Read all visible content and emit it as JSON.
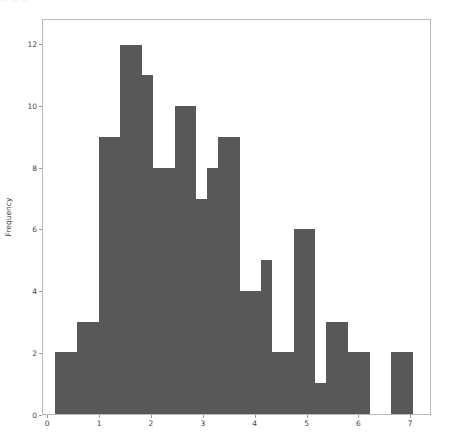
{
  "figure": {
    "background_color": "#ffffff",
    "top_artifact_text": "·        ·                              —                          —"
  },
  "axes": {
    "frame_color": "#b9b9bd",
    "tick_color": "#9a9aa0",
    "label_color": "#3f3f43"
  },
  "chart_data": {
    "type": "bar",
    "subtype": "histogram",
    "title": "",
    "subtitle": "",
    "xlabel": "",
    "ylabel": "Frequency",
    "grid": false,
    "legend": null,
    "bar_color": "#585858",
    "bar_edge_color": "#585858",
    "xlim": [
      -0.1,
      7.4
    ],
    "ylim": [
      0,
      12.8
    ],
    "xticks": [
      0,
      1,
      2,
      3,
      4,
      5,
      6,
      7
    ],
    "xtick_labels": [
      "0",
      "1",
      "2",
      "3",
      "4",
      "5",
      "6",
      "7"
    ],
    "yticks": [
      0,
      2,
      4,
      6,
      8,
      10,
      12
    ],
    "ytick_labels": [
      "0",
      "2",
      "4",
      "6",
      "8",
      "10",
      "12"
    ],
    "bin_width": 0.42,
    "bin_edges": [
      0.14,
      0.56,
      0.98,
      1.4,
      1.82,
      2.24,
      2.66,
      3.08,
      3.5,
      3.92,
      4.34,
      4.76,
      5.18,
      5.6,
      6.02,
      6.44,
      6.86
    ],
    "bin_starts": [
      0.14,
      0.56,
      0.98,
      1.4,
      1.82,
      2.24,
      2.66,
      3.08,
      3.5,
      3.92,
      4.34,
      4.76,
      5.18,
      5.6,
      6.02,
      6.44,
      6.86
    ],
    "bin_centers": [
      0.35,
      0.77,
      1.19,
      1.61,
      2.03,
      2.45,
      2.87,
      3.29,
      3.71,
      4.13,
      4.55,
      4.97,
      5.39,
      5.81,
      6.23,
      6.65,
      7.07
    ],
    "values": [
      2,
      3,
      9,
      12,
      11,
      8,
      10,
      7,
      8,
      9,
      4,
      5,
      2,
      6,
      1,
      3,
      2,
      0,
      2
    ],
    "counts": [
      2,
      3,
      9,
      12,
      11,
      8,
      10,
      7,
      8,
      9,
      4,
      5,
      2,
      6,
      1,
      3,
      2,
      0,
      2
    ],
    "total_count": 96,
    "max_value": 12,
    "bars": [
      {
        "x0": 0.14,
        "x1": 0.56,
        "height": 2
      },
      {
        "x0": 0.56,
        "x1": 0.98,
        "height": 3
      },
      {
        "x0": 0.98,
        "x1": 1.4,
        "height": 9
      },
      {
        "x0": 1.4,
        "x1": 1.82,
        "height": 12
      },
      {
        "x0": 1.82,
        "x1": 2.03,
        "height": 11
      },
      {
        "x0": 2.03,
        "x1": 2.45,
        "height": 8
      },
      {
        "x0": 2.45,
        "x1": 2.87,
        "height": 10
      },
      {
        "x0": 2.87,
        "x1": 3.08,
        "height": 7
      },
      {
        "x0": 3.08,
        "x1": 3.29,
        "height": 8
      },
      {
        "x0": 3.29,
        "x1": 3.71,
        "height": 9
      },
      {
        "x0": 3.71,
        "x1": 4.13,
        "height": 4
      },
      {
        "x0": 4.13,
        "x1": 4.34,
        "height": 5
      },
      {
        "x0": 4.34,
        "x1": 4.76,
        "height": 2
      },
      {
        "x0": 4.76,
        "x1": 5.18,
        "height": 6
      },
      {
        "x0": 5.18,
        "x1": 5.39,
        "height": 1
      },
      {
        "x0": 5.39,
        "x1": 5.81,
        "height": 3
      },
      {
        "x0": 5.81,
        "x1": 6.23,
        "height": 2
      },
      {
        "x0": 6.23,
        "x1": 6.65,
        "height": 0
      },
      {
        "x0": 6.65,
        "x1": 7.07,
        "height": 2
      }
    ]
  }
}
